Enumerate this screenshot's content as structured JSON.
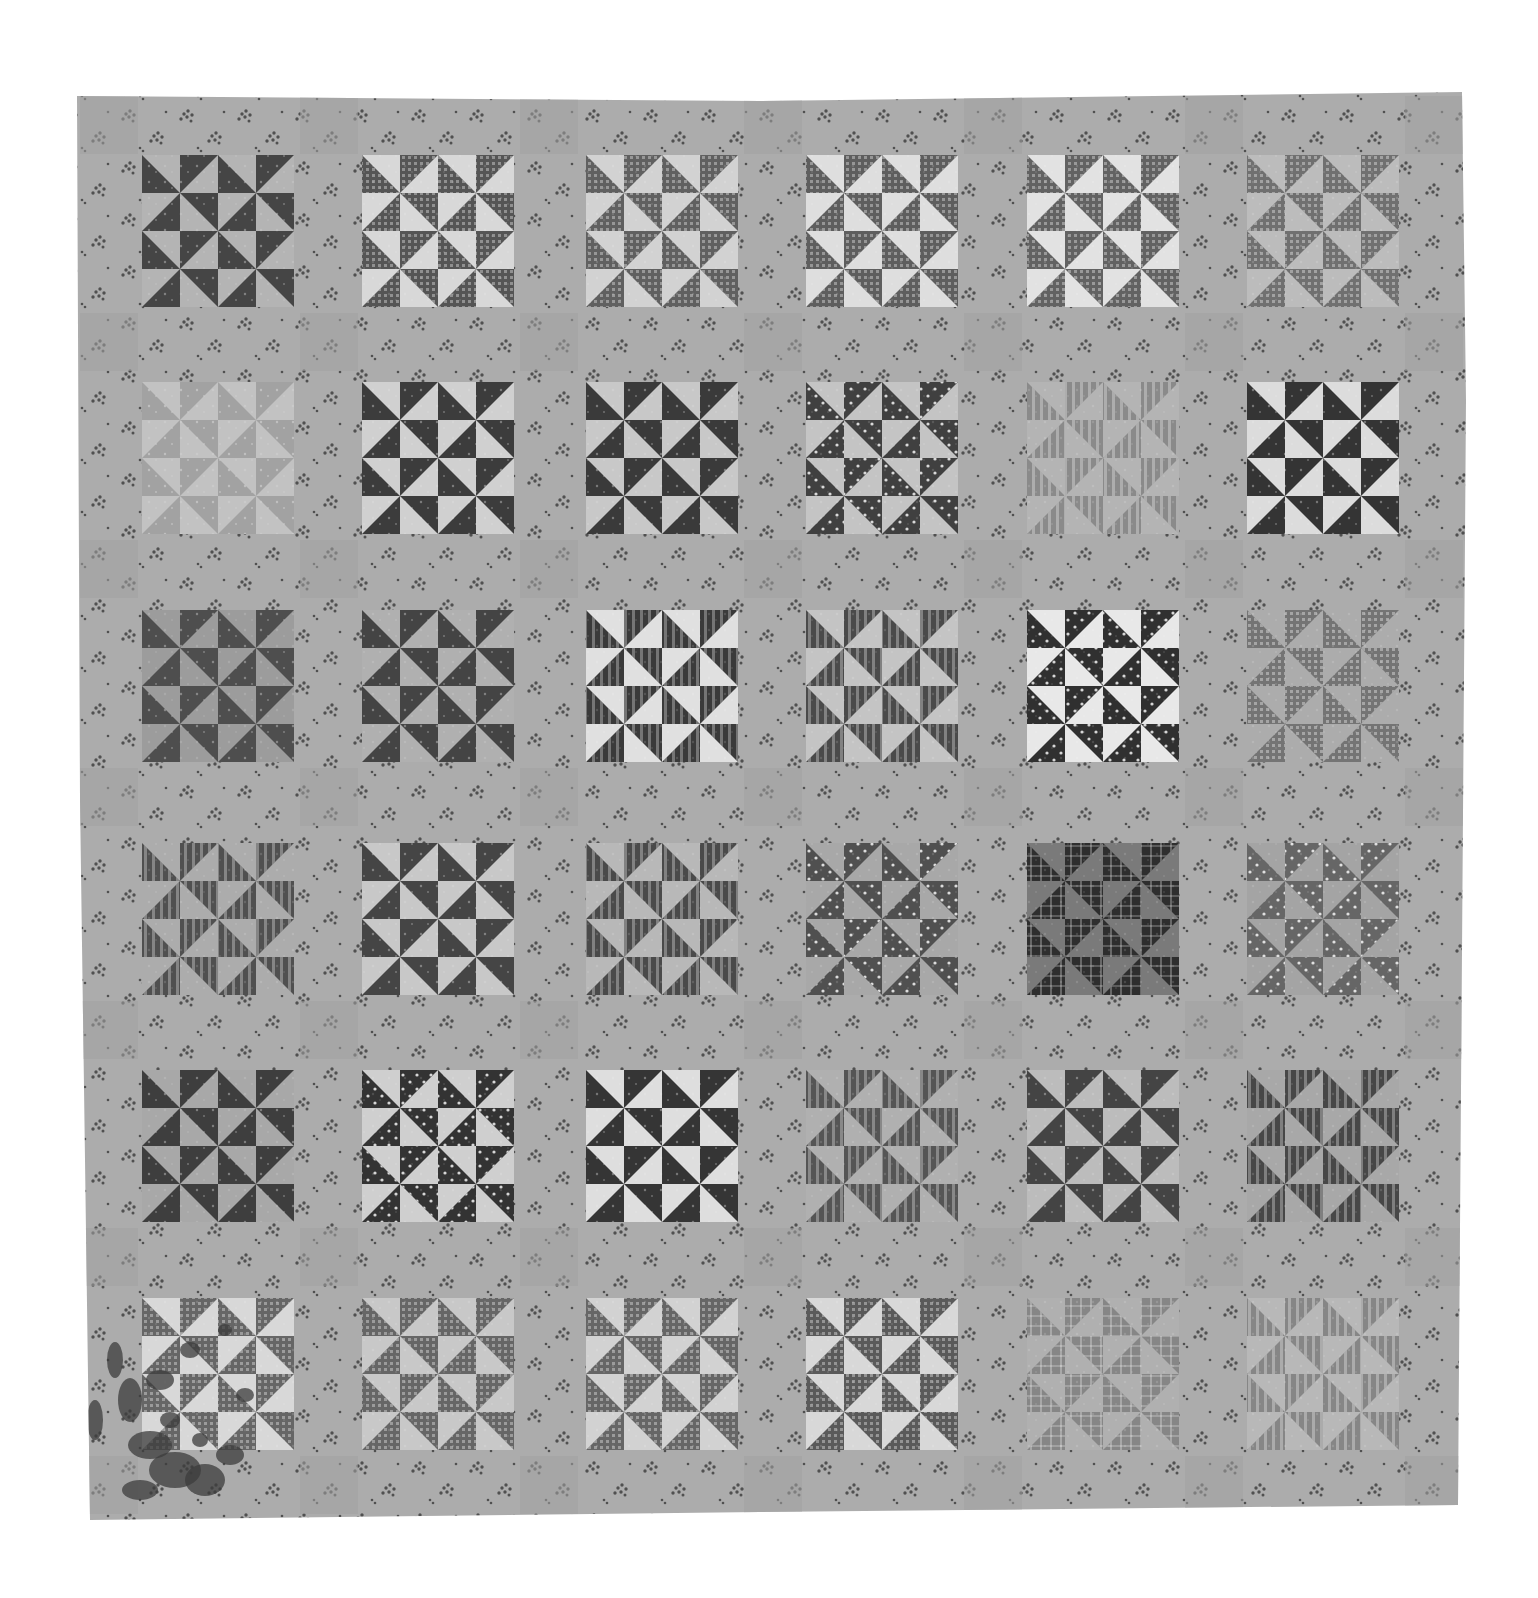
{
  "image": {
    "subject": "Pinwheel pattern patchwork quilt",
    "photo_type": "black-and-white photograph",
    "background_color": "#ffffff"
  },
  "quilt": {
    "outline": [
      [
        77,
        96
      ],
      [
        760,
        101
      ],
      [
        1462,
        92
      ],
      [
        1466,
        400
      ],
      [
        1458,
        1505
      ],
      [
        760,
        1512
      ],
      [
        90,
        1520
      ],
      [
        80,
        800
      ]
    ],
    "sashing": {
      "base_color": "#acacac",
      "sprig_color": "#505050",
      "cornerstone_color": "#a2a2a2"
    },
    "grid": {
      "rows": 6,
      "cols": 6
    },
    "block_cells": 4,
    "col_x": [
      142,
      362,
      586,
      806,
      1027,
      1247
    ],
    "row_y": [
      155,
      382,
      610,
      843,
      1070,
      1298
    ],
    "block_size": 152,
    "blocks": [
      [
        {
          "dark": "#454545",
          "light": "#b4b4b4",
          "fabric": "print"
        },
        {
          "dark": "#555555",
          "light": "#d8d8d8",
          "fabric": "gingham"
        },
        {
          "dark": "#606060",
          "light": "#d2d2d2",
          "fabric": "gingham"
        },
        {
          "dark": "#5e5e5e",
          "light": "#dedede",
          "fabric": "gingham"
        },
        {
          "dark": "#626262",
          "light": "#e2e2e2",
          "fabric": "gingham"
        },
        {
          "dark": "#707070",
          "light": "#bcbcbc",
          "fabric": "gingham"
        }
      ],
      [
        {
          "dark": "#a2a2a2",
          "light": "#c2c2c2",
          "fabric": "print"
        },
        {
          "dark": "#3c3c3c",
          "light": "#d0d0d0",
          "fabric": "print"
        },
        {
          "dark": "#3a3a3a",
          "light": "#c8c8c8",
          "fabric": "print"
        },
        {
          "dark": "#404040",
          "light": "#c4c4c4",
          "fabric": "dots"
        },
        {
          "dark": "#8a8a8a",
          "light": "#b4b4b4",
          "fabric": "stripe"
        },
        {
          "dark": "#343434",
          "light": "#dcdcdc",
          "fabric": "print"
        }
      ],
      [
        {
          "dark": "#4e4e4e",
          "light": "#9c9c9c",
          "fabric": "print"
        },
        {
          "dark": "#444444",
          "light": "#b0b0b0",
          "fabric": "print"
        },
        {
          "dark": "#3a3a3a",
          "light": "#e0e0e0",
          "fabric": "stripe"
        },
        {
          "dark": "#4a4a4a",
          "light": "#c4c4c4",
          "fabric": "stripe"
        },
        {
          "dark": "#303030",
          "light": "#e8e8e8",
          "fabric": "dots"
        },
        {
          "dark": "#747474",
          "light": "#acacac",
          "fabric": "gingham"
        }
      ],
      [
        {
          "dark": "#505050",
          "light": "#acacac",
          "fabric": "stripe"
        },
        {
          "dark": "#454545",
          "light": "#c8c8c8",
          "fabric": "print"
        },
        {
          "dark": "#4a4a4a",
          "light": "#b8b8b8",
          "fabric": "stripe"
        },
        {
          "dark": "#505050",
          "light": "#a8a8a8",
          "fabric": "dots"
        },
        {
          "dark": "#2e2e2e",
          "light": "#7a7a7a",
          "fabric": "plaid"
        },
        {
          "dark": "#666666",
          "light": "#a4a4a4",
          "fabric": "dots"
        }
      ],
      [
        {
          "dark": "#3e3e3e",
          "light": "#a8a8a8",
          "fabric": "print"
        },
        {
          "dark": "#333333",
          "light": "#cfcfcf",
          "fabric": "dots"
        },
        {
          "dark": "#353535",
          "light": "#dedede",
          "fabric": "print"
        },
        {
          "dark": "#555555",
          "light": "#b0b0b0",
          "fabric": "stripe"
        },
        {
          "dark": "#444444",
          "light": "#bcbcbc",
          "fabric": "print"
        },
        {
          "dark": "#474747",
          "light": "#a8a8a8",
          "fabric": "stripe"
        }
      ],
      [
        {
          "dark": "#666666",
          "light": "#d8d8d8",
          "fabric": "gingham"
        },
        {
          "dark": "#666666",
          "light": "#c8c8c8",
          "fabric": "gingham"
        },
        {
          "dark": "#666666",
          "light": "#d2d2d2",
          "fabric": "gingham"
        },
        {
          "dark": "#5a5a5a",
          "light": "#d8d8d8",
          "fabric": "gingham"
        },
        {
          "dark": "#868686",
          "light": "#b0b0b0",
          "fabric": "plaid"
        },
        {
          "dark": "#868686",
          "light": "#b8b8b8",
          "fabric": "stripe"
        }
      ]
    ],
    "stain": {
      "color": "#3c3c3c",
      "location": "bottom-left corner"
    }
  }
}
